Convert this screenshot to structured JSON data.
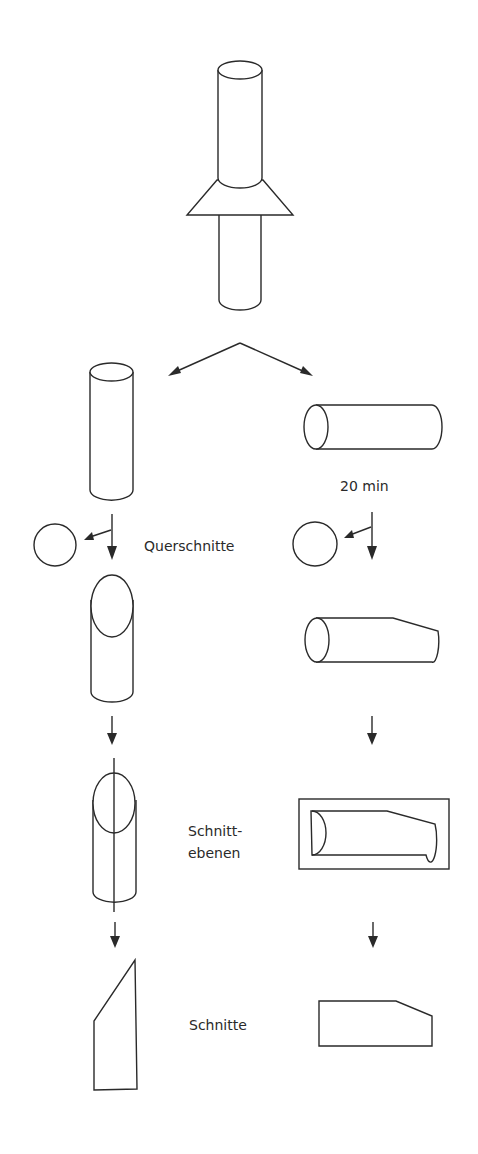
{
  "labels": {
    "time": "20 min",
    "cross_sections": "Querschnitte",
    "section_planes_line1": "Schnitt-",
    "section_planes_line2": "ebenen",
    "sections": "Schnitte"
  },
  "colors": {
    "line": "#2a2a2a",
    "background": "#ffffff"
  }
}
